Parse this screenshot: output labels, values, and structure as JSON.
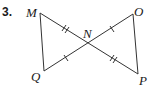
{
  "problem_number": "3.",
  "points": {
    "M": {
      "label": "M",
      "x": 40,
      "y": 13
    },
    "N": {
      "label": "N",
      "x": 88,
      "y": 44
    },
    "O": {
      "label": "O",
      "x": 133,
      "y": 14
    },
    "Q": {
      "label": "Q",
      "x": 44,
      "y": 71
    },
    "P": {
      "label": "P",
      "x": 138,
      "y": 74
    }
  },
  "segments": [
    {
      "from": "M",
      "to": "N",
      "ticks": 2
    },
    {
      "from": "N",
      "to": "P",
      "ticks": 2
    },
    {
      "from": "Q",
      "to": "N",
      "ticks": 1
    },
    {
      "from": "N",
      "to": "O",
      "ticks": 1
    },
    {
      "from": "M",
      "to": "Q",
      "ticks": 0
    },
    {
      "from": "O",
      "to": "P",
      "ticks": 0
    }
  ],
  "line_color": "#333333"
}
